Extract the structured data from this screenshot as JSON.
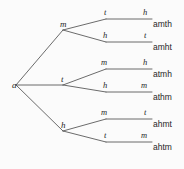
{
  "diagram": {
    "stroke_color": "#5a5a5a",
    "text_color": "#1f1f1f",
    "background_color": "#fbfbfb",
    "root": {
      "label": "a",
      "x": 16,
      "y": 85
    },
    "level1_nodes": [
      {
        "label": "m",
        "x": 63,
        "y": 30
      },
      {
        "label": "t",
        "x": 63,
        "y": 85
      },
      {
        "label": "h",
        "x": 63,
        "y": 131
      }
    ],
    "level2_nodes": [
      {
        "label": "t",
        "x": 112,
        "y": 24
      },
      {
        "label": "h",
        "x": 112,
        "y": 47
      },
      {
        "label": "m",
        "x": 112,
        "y": 74
      },
      {
        "label": "h",
        "x": 112,
        "y": 97
      },
      {
        "label": "m",
        "x": 112,
        "y": 124
      },
      {
        "label": "t",
        "x": 112,
        "y": 147
      }
    ],
    "level3_labels": [
      {
        "label": "h",
        "x": 144,
        "y": 24
      },
      {
        "label": "t",
        "x": 144,
        "y": 47
      },
      {
        "label": "h",
        "x": 144,
        "y": 74
      },
      {
        "label": "m",
        "x": 144,
        "y": 97
      },
      {
        "label": "t",
        "x": 144,
        "y": 124
      },
      {
        "label": "m",
        "x": 144,
        "y": 147
      }
    ],
    "outcomes": [
      {
        "label": "amth",
        "x": 154,
        "y": 24
      },
      {
        "label": "amht",
        "x": 154,
        "y": 47
      },
      {
        "label": "atmh",
        "x": 154,
        "y": 74
      },
      {
        "label": "athm",
        "x": 154,
        "y": 97
      },
      {
        "label": "ahmt",
        "x": 154,
        "y": 124
      },
      {
        "label": "ahtm",
        "x": 154,
        "y": 147
      }
    ],
    "branches": [
      {
        "name": "root-to-m",
        "from": [
          16,
          85
        ],
        "to": [
          63,
          30
        ]
      },
      {
        "name": "root-to-t",
        "from": [
          16,
          85
        ],
        "to": [
          63,
          85
        ]
      },
      {
        "name": "root-to-h",
        "from": [
          16,
          85
        ],
        "to": [
          63,
          131
        ]
      },
      {
        "name": "m-to-t",
        "from": [
          63,
          30
        ],
        "to": [
          106,
          19
        ]
      },
      {
        "name": "m-to-h",
        "from": [
          63,
          30
        ],
        "to": [
          106,
          42
        ]
      },
      {
        "name": "t-to-m",
        "from": [
          63,
          85
        ],
        "to": [
          106,
          69
        ]
      },
      {
        "name": "t-to-h",
        "from": [
          63,
          85
        ],
        "to": [
          106,
          92
        ]
      },
      {
        "name": "h-to-m",
        "from": [
          63,
          131
        ],
        "to": [
          106,
          119
        ]
      },
      {
        "name": "h-to-t",
        "from": [
          63,
          131
        ],
        "to": [
          106,
          142
        ]
      }
    ],
    "terminal_segments": [
      {
        "name": "segment-amth",
        "from": [
          106,
          19
        ],
        "to": [
          152,
          19
        ]
      },
      {
        "name": "segment-amht",
        "from": [
          106,
          42
        ],
        "to": [
          152,
          42
        ]
      },
      {
        "name": "segment-atmh",
        "from": [
          106,
          69
        ],
        "to": [
          152,
          69
        ]
      },
      {
        "name": "segment-athm",
        "from": [
          106,
          92
        ],
        "to": [
          152,
          92
        ]
      },
      {
        "name": "segment-ahmt",
        "from": [
          106,
          119
        ],
        "to": [
          152,
          119
        ]
      },
      {
        "name": "segment-ahtm",
        "from": [
          106,
          142
        ],
        "to": [
          152,
          142
        ]
      }
    ]
  }
}
